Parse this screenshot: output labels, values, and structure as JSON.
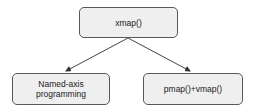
{
  "diagram": {
    "nodes": [
      {
        "id": "root",
        "label": "xmap()"
      },
      {
        "id": "left",
        "label_lines": [
          "Named-axis",
          "programming"
        ]
      },
      {
        "id": "right",
        "label": "pmap()+vmap()"
      }
    ],
    "edges": [
      {
        "from": "root",
        "to": "left"
      },
      {
        "from": "root",
        "to": "right"
      }
    ],
    "colors": {
      "node_fill": "#efefef",
      "node_border": "#595959",
      "edge": "#444444",
      "text": "#222222"
    }
  }
}
